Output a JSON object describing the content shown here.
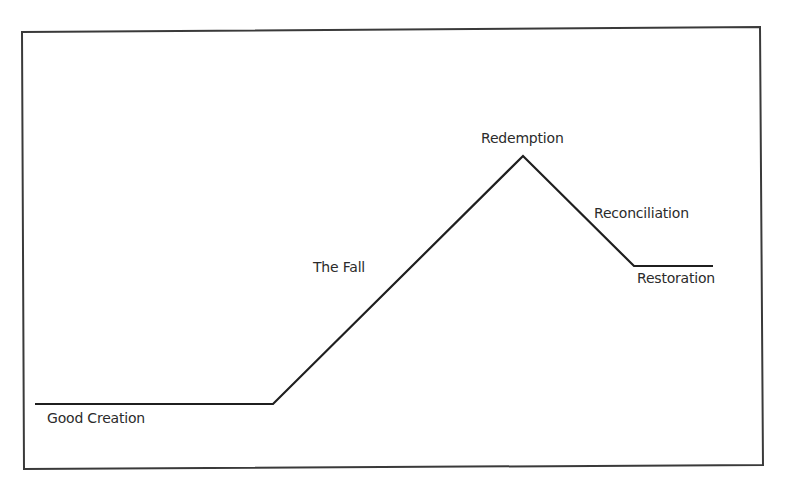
{
  "diagram": {
    "type": "line-path",
    "colors": {
      "background": "#ffffff",
      "frame": "#3a3a3a",
      "line": "#1f1f1f",
      "text": "#2b2b2b"
    },
    "stages": [
      {
        "id": "good-creation",
        "label": "Good Creation"
      },
      {
        "id": "the-fall",
        "label": "The Fall"
      },
      {
        "id": "redemption",
        "label": "Redemption"
      },
      {
        "id": "reconciliation",
        "label": "Reconciliation"
      },
      {
        "id": "restoration",
        "label": "Restoration"
      }
    ],
    "path_points": [
      {
        "x": 35,
        "y": 404
      },
      {
        "x": 273,
        "y": 404
      },
      {
        "x": 523,
        "y": 156
      },
      {
        "x": 634,
        "y": 266
      },
      {
        "x": 713,
        "y": 266
      }
    ],
    "frame": {
      "points": [
        {
          "x": 22,
          "y": 32
        },
        {
          "x": 760,
          "y": 27
        },
        {
          "x": 763,
          "y": 465
        },
        {
          "x": 24,
          "y": 469
        }
      ]
    }
  }
}
